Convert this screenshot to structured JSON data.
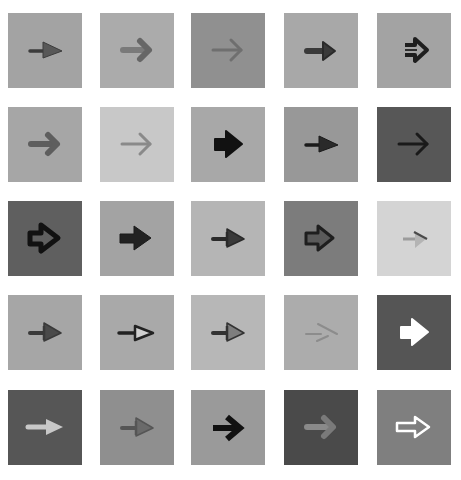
{
  "grid": {
    "rows": 5,
    "cols": 5,
    "col_x": [
      8,
      100,
      191,
      284,
      377
    ],
    "row_y": [
      13,
      107,
      201,
      295,
      390
    ]
  },
  "tiles": [
    {
      "row": 0,
      "col": 0,
      "bg": "#a3a3a3",
      "style": "pointer-thin",
      "fill": "#585858",
      "stroke": "#3c3c3c"
    },
    {
      "row": 0,
      "col": 1,
      "bg": "#ababab",
      "style": "rounded-chevron",
      "fill": "#7a7a7a",
      "stroke": "#666666"
    },
    {
      "row": 0,
      "col": 2,
      "bg": "#909090",
      "style": "chevron-line",
      "fill": "#6f6f6f",
      "stroke": "#6f6f6f"
    },
    {
      "row": 0,
      "col": 3,
      "bg": "#a8a8a8",
      "style": "bold-short",
      "fill": "#3a3a3a",
      "stroke": "#2a2a2a"
    },
    {
      "row": 0,
      "col": 4,
      "bg": "#a3a3a3",
      "style": "double-outline",
      "fill": "#2e2e2e",
      "stroke": "#1e1e1e"
    },
    {
      "row": 1,
      "col": 0,
      "bg": "#a6a6a6",
      "style": "rounded-chevron",
      "fill": "#5e5e5e",
      "stroke": "#5e5e5e"
    },
    {
      "row": 1,
      "col": 1,
      "bg": "#c8c8c8",
      "style": "chevron-line",
      "fill": "#8a8a8a",
      "stroke": "#8a8a8a"
    },
    {
      "row": 1,
      "col": 2,
      "bg": "#a8a8a8",
      "style": "fat-block",
      "fill": "#111111",
      "stroke": "#111111"
    },
    {
      "row": 1,
      "col": 3,
      "bg": "#989898",
      "style": "pointer-thin",
      "fill": "#2a2a2a",
      "stroke": "#1a1a1a"
    },
    {
      "row": 1,
      "col": 4,
      "bg": "#575757",
      "style": "chevron-line",
      "fill": "#1a1a1a",
      "stroke": "#1a1a1a"
    },
    {
      "row": 2,
      "col": 0,
      "bg": "#5f5f5f",
      "style": "outline-bold",
      "fill": "none",
      "stroke": "#111111"
    },
    {
      "row": 2,
      "col": 1,
      "bg": "#a3a3a3",
      "style": "block",
      "fill": "#222222",
      "stroke": "#1a1a1a"
    },
    {
      "row": 2,
      "col": 2,
      "bg": "#b5b5b5",
      "style": "pointer-3d",
      "fill": "#3a3a3a",
      "stroke": "#2a2a2a"
    },
    {
      "row": 2,
      "col": 3,
      "bg": "#7c7c7c",
      "style": "outline-3d",
      "fill": "#5a5a5a",
      "stroke": "#1e1e1e"
    },
    {
      "row": 2,
      "col": 4,
      "bg": "#d4d4d4",
      "style": "faint-pointer",
      "fill": "#b4b4b4",
      "stroke": "#4a4a4a"
    },
    {
      "row": 3,
      "col": 0,
      "bg": "#a6a6a6",
      "style": "pointer-3d",
      "fill": "#4a4a4a",
      "stroke": "#3a3a3a"
    },
    {
      "row": 3,
      "col": 1,
      "bg": "#a9a9a9",
      "style": "outline-pointer",
      "fill": "#d0d0d0",
      "stroke": "#222222"
    },
    {
      "row": 3,
      "col": 2,
      "bg": "#b7b7b7",
      "style": "pointer-3d",
      "fill": "#7e7e7e",
      "stroke": "#333333"
    },
    {
      "row": 3,
      "col": 3,
      "bg": "#acacac",
      "style": "faint-chevron",
      "fill": "#8c8c8c",
      "stroke": "#8c8c8c"
    },
    {
      "row": 3,
      "col": 4,
      "bg": "#555555",
      "style": "fat-block",
      "fill": "#ffffff",
      "stroke": "#ffffff"
    },
    {
      "row": 4,
      "col": 0,
      "bg": "#565656",
      "style": "light-short",
      "fill": "#c8c8c8",
      "stroke": "#c8c8c8"
    },
    {
      "row": 4,
      "col": 1,
      "bg": "#8f8f8f",
      "style": "pointer-3d",
      "fill": "#6a6a6a",
      "stroke": "#555555"
    },
    {
      "row": 4,
      "col": 2,
      "bg": "#9a9a9a",
      "style": "bold-chevron",
      "fill": "#111111",
      "stroke": "#111111"
    },
    {
      "row": 4,
      "col": 3,
      "bg": "#4a4a4a",
      "style": "rounded-chevron",
      "fill": "#8a8a8a",
      "stroke": "#7a7a7a"
    },
    {
      "row": 4,
      "col": 4,
      "bg": "#7f7f7f",
      "style": "outline-white",
      "fill": "none",
      "stroke": "#ffffff"
    }
  ]
}
